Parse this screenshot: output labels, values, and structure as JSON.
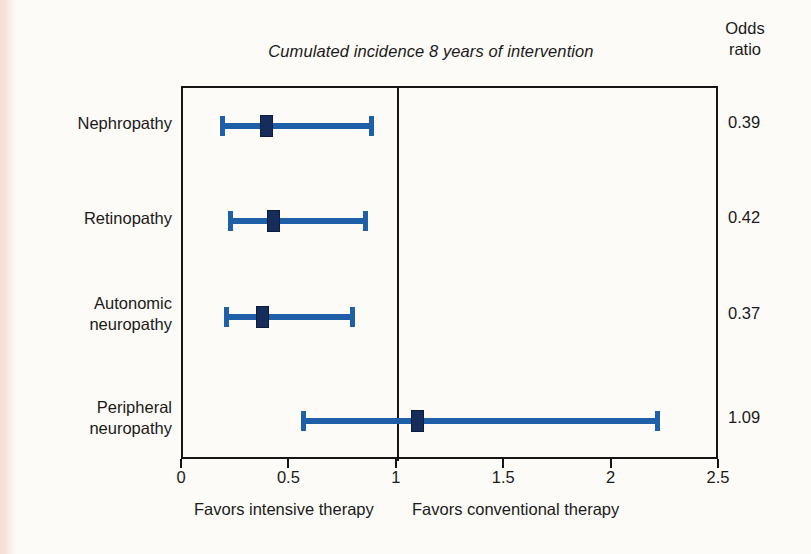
{
  "chart_data": {
    "type": "forest",
    "title": "Cumulated incidence 8 years of intervention",
    "xlabel": "",
    "ylabel": "",
    "xlim": [
      0,
      2.5
    ],
    "grid": false,
    "null_value": 1,
    "value_column_header_line1": "Odds",
    "value_column_header_line2": "ratio",
    "x_ticks": [
      "0",
      "0.5",
      "1",
      "1.5",
      "2",
      "2.5"
    ],
    "x_tick_values": [
      0,
      0.5,
      1,
      1.5,
      2,
      2.5
    ],
    "left_footer": "Favors intensive therapy",
    "right_footer": "Favors conventional therapy",
    "categories": [
      "Nephropathy",
      "Retinopathy",
      "Autonomic neuropathy",
      "Peripheral neuropathy"
    ],
    "rows": [
      {
        "label_line1": "Nephropathy",
        "label_line2": "",
        "odds_ratio": "0.39",
        "estimate": 0.39,
        "ci_low": 0.17,
        "ci_high": 0.89
      },
      {
        "label_line1": "Retinopathy",
        "label_line2": "",
        "odds_ratio": "0.42",
        "estimate": 0.42,
        "ci_low": 0.21,
        "ci_high": 0.86
      },
      {
        "label_line1": "Autonomic",
        "label_line2": "neuropathy",
        "odds_ratio": "0.37",
        "estimate": 0.37,
        "ci_low": 0.19,
        "ci_high": 0.8
      },
      {
        "label_line1": "Peripheral",
        "label_line2": "neuropathy",
        "odds_ratio": "1.09",
        "estimate": 1.09,
        "ci_low": 0.55,
        "ci_high": 2.22
      }
    ],
    "colors": {
      "ci_line": "#1f5fa8",
      "marker": "#162d5c",
      "axis": "#151515",
      "background": "#fdfbf7"
    }
  }
}
